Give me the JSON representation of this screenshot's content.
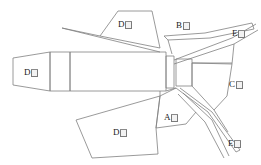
{
  "figure": {
    "type": "technical-line-drawing",
    "background_color": "#ffffff",
    "stroke_color": "#808080",
    "stroke_width": 0.8,
    "width": 261,
    "height": 165,
    "labels": [
      {
        "id": "label-d-upper-fin",
        "letter": "D",
        "glyph": "tofu",
        "text": "D☒",
        "x": 118,
        "y": 20
      },
      {
        "id": "label-b-upper-strip",
        "letter": "B",
        "glyph": "tofu",
        "text": "B☒",
        "x": 176,
        "y": 21
      },
      {
        "id": "label-e-upper-right",
        "letter": "E",
        "glyph": "tofu",
        "text": "E☒",
        "x": 232,
        "y": 29
      },
      {
        "id": "label-d-nozzle",
        "letter": "D",
        "glyph": "tofu",
        "text": "D☒",
        "x": 24,
        "y": 68
      },
      {
        "id": "label-c-right",
        "letter": "C",
        "glyph": "tofu",
        "text": "C☒",
        "x": 229,
        "y": 80
      },
      {
        "id": "label-a-lower",
        "letter": "A",
        "glyph": "tofu",
        "text": "A☒",
        "x": 164,
        "y": 113
      },
      {
        "id": "label-d-lower-fin",
        "letter": "D",
        "glyph": "tofu",
        "text": "D☒",
        "x": 113,
        "y": 128
      },
      {
        "id": "label-e-lower-right",
        "letter": "E",
        "glyph": "tofu",
        "text": "E☒",
        "x": 228,
        "y": 139
      }
    ]
  },
  "parts": {
    "nozzle": "tapered-nozzle",
    "body": "cylindrical-body",
    "mid_segment": "mid-collar",
    "nose": "nose-section",
    "upper_fin": "upper-left-fin",
    "lower_fin": "lower-left-fin",
    "upper_strip": "upper-right-strip",
    "lower_strips": "lower-right-crossing-strips"
  }
}
